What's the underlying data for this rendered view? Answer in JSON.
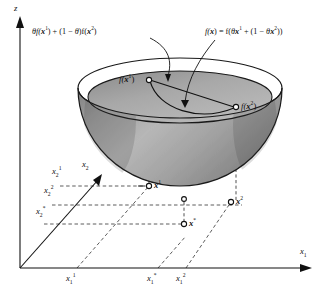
{
  "figure": {
    "type": "3d-diagram",
    "background_color": "#ffffff",
    "ink_color": "#111111",
    "bowl_outer_color": "#9a9a9a",
    "bowl_inner_color": "#b4b4b4",
    "bowl_rim_color": "#8c8c8c"
  },
  "axes": {
    "z_label": "z",
    "x1_label_base": "x",
    "x1_label_sub": "1",
    "x2_label_base": "x",
    "x2_label_sub": "2"
  },
  "annotations": {
    "left": {
      "text": "θf(x¹) + (1 − θ)f(x²)",
      "parts": [
        "θ",
        "f(",
        "x",
        "1",
        ") + (1 − ",
        "θ",
        ")f(",
        "x",
        "2",
        ")"
      ]
    },
    "right": {
      "text": "f(x) = f(θx¹ + (1 − θx²))",
      "parts": [
        "f(",
        "x",
        ") = f(",
        "θ",
        "x",
        "1",
        " + (1 − ",
        "θ",
        "x",
        "2",
        "))"
      ]
    }
  },
  "surface_points": [
    {
      "id": "fx1",
      "label_base": "f(",
      "label_var": "x",
      "label_sup": "1",
      "label_close": ")",
      "x": 148,
      "y": 80
    },
    {
      "id": "fx2",
      "label_base": "f(",
      "label_var": "x",
      "label_sup": "2",
      "label_close": ")",
      "x": 236,
      "y": 107
    }
  ],
  "plane_points": [
    {
      "id": "x1",
      "label_var": "x",
      "label_sup": "1",
      "x": 149,
      "y": 186
    },
    {
      "id": "xstar",
      "label_var": "x",
      "label_sup": "*",
      "x": 184,
      "y": 224
    },
    {
      "id": "x2",
      "label_var": "x",
      "label_sup": "2",
      "x": 231,
      "y": 202
    }
  ],
  "x1_ticks": [
    {
      "label_var": "x",
      "label_sub": "1",
      "label_sup": "1",
      "x": 71
    },
    {
      "label_var": "x",
      "label_sub": "1",
      "label_sup": "*",
      "x": 152
    },
    {
      "label_var": "x",
      "label_sub": "1",
      "label_sup": "2",
      "x": 180
    }
  ],
  "x2_ticks": [
    {
      "label_var": "x",
      "label_sub": "2",
      "label_sup": "1",
      "y": 172
    },
    {
      "label_var": "x",
      "label_sub": "2",
      "label_sup": "2",
      "y": 191
    },
    {
      "label_var": "x",
      "label_sub": "2",
      "label_sup": "*",
      "y": 212
    }
  ]
}
